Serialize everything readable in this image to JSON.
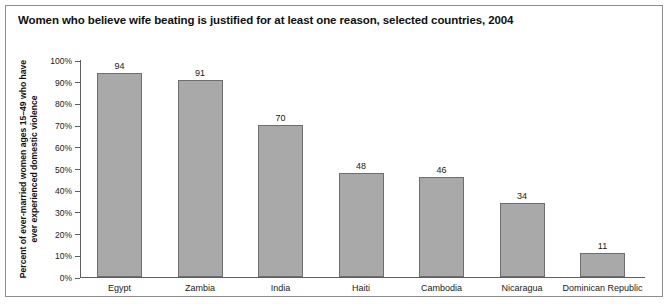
{
  "chart_data": {
    "type": "bar",
    "title": "Women who believe wife beating is justified for at least one reason, selected countries, 2004",
    "xlabel": "",
    "ylabel": "Percent of ever-married women ages 15–49 who have ever experienced domestic violence",
    "ylabel_lines": [
      "Percent of ever-married women ages 15–49 who have",
      "ever experienced domestic violence"
    ],
    "categories": [
      "Egypt",
      "Zambia",
      "India",
      "Haiti",
      "Cambodia",
      "Nicaragua",
      "Dominican Republic"
    ],
    "values": [
      94,
      91,
      70,
      48,
      46,
      34,
      11
    ],
    "ylim": [
      0,
      100
    ],
    "ytick_values": [
      0,
      10,
      20,
      30,
      40,
      50,
      60,
      70,
      80,
      90,
      100
    ],
    "ytick_labels": [
      "0%",
      "10%",
      "20%",
      "30%",
      "40%",
      "50%",
      "60%",
      "70%",
      "80%",
      "90%",
      "100%"
    ],
    "grid": false,
    "legend": false,
    "bar_color": "#a9a9a9",
    "bar_border_color": "#6e6e6e",
    "axis_color": "#5f5f5f",
    "frame_color": "#8d8d8d"
  }
}
